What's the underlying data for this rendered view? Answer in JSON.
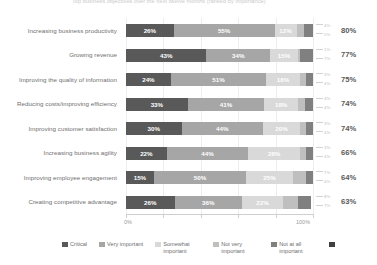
{
  "title": "Top business objectives over the next twelve months (ranked by importance)",
  "chart_data": {
    "type": "bar",
    "title": "Top business objectives over the next twelve months (ranked by importance)",
    "xlabel": "",
    "ylabel": "",
    "xlim": [
      0,
      100
    ],
    "grid": true,
    "legend_position": "bottom",
    "stacked": true,
    "stack_mode": "percent",
    "orientation": "horizontal",
    "categories": [
      "Increasing business productivity",
      "Growing revenue",
      "Improving the quality of information",
      "Reducing costs/improving efficiency",
      "Improving customer satisfaction",
      "Increasing business agility",
      "Improving employee engagement",
      "Creating competitive advantage"
    ],
    "series": [
      {
        "name": "Critical",
        "color": "#595959",
        "values": [
          26,
          43,
          24,
          33,
          30,
          22,
          15,
          26
        ]
      },
      {
        "name": "Very important",
        "color": "#a6a6a6",
        "values": [
          55,
          34,
          51,
          41,
          44,
          44,
          50,
          36
        ]
      },
      {
        "name": "Somewhat important",
        "color": "#d9d9d9",
        "values": [
          12,
          15,
          18,
          18,
          20,
          28,
          25,
          22
        ]
      },
      {
        "name": "Not very important",
        "color": "#bfbfbf",
        "values": [
          4,
          1,
          3,
          4,
          3,
          3,
          7,
          8
        ]
      },
      {
        "name": "Not at all important",
        "color": "#808080",
        "values": [
          5,
          7,
          4,
          4,
          4,
          4,
          4,
          7
        ]
      }
    ],
    "net_top2": [
      80,
      77,
      75,
      74,
      74,
      66,
      64,
      63
    ],
    "xticks": [
      0,
      20,
      40,
      60,
      80,
      100
    ],
    "xticklabels": [
      "0%",
      "",
      "",
      "",
      "",
      "100%"
    ]
  },
  "axis": {
    "start_label": "0%",
    "end_label": "100%"
  },
  "legend": {
    "items": [
      {
        "label": "Critical",
        "color": "#595959"
      },
      {
        "label": "Very important",
        "color": "#a6a6a6"
      },
      {
        "label": "Somewhat important",
        "color": "#d9d9d9"
      },
      {
        "label": "Not very important",
        "color": "#bfbfbf"
      },
      {
        "label": "Not at all important",
        "color": "#808080"
      },
      {
        "label": "(NET) Top 2",
        "color": "#404040"
      }
    ]
  }
}
